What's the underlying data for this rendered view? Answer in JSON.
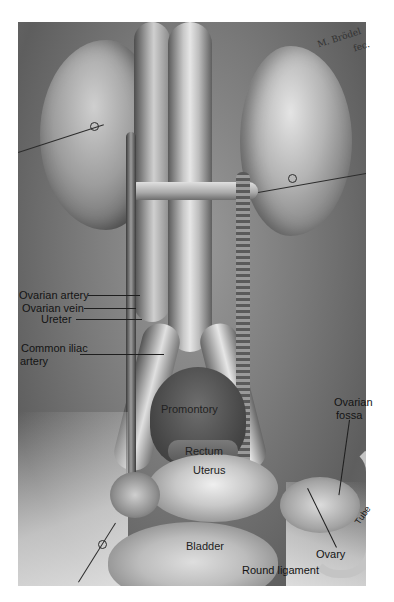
{
  "figure": {
    "signature": [
      "M. Brödel",
      "fec."
    ],
    "colors": {
      "background": "#ffffff",
      "label_text": "#141414",
      "plate_tone": "#7a7a7a"
    }
  },
  "labels": {
    "ovarian_artery": "Ovarian artery",
    "ovarian_vein": "Ovarian vein",
    "ureter": "Ureter",
    "common_iliac_line1": "Common iliac",
    "common_iliac_line2": "artery",
    "promontory": "Promontory",
    "rectum": "Rectum",
    "uterus": "Uterus",
    "ovarian_fossa_line1": "Ovarian",
    "ovarian_fossa_line2": "fossa",
    "tube": "Tube",
    "ovary": "Ovary",
    "bladder": "Bladder",
    "round_ligament": "Round ligament"
  }
}
